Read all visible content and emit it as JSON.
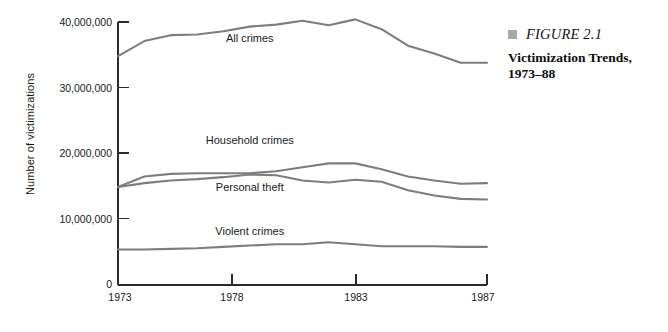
{
  "caption": {
    "bullet_icon": "filled-square-icon",
    "figure_number": "FIGURE 2.1",
    "title": "Victimization Trends, 1973–88",
    "bullet_color": "#a8a8a8"
  },
  "axes": {
    "y_axis_title": "Number of victimizations",
    "y_ticks": [
      "10,000,000",
      "20,000,000",
      "30,000,000",
      "40,000,000"
    ],
    "x_ticks": [
      "1973",
      "1978",
      "1983",
      "1987"
    ],
    "origin_label": "0"
  },
  "chart_data": {
    "type": "line",
    "title": "Victimization Trends, 1973–88",
    "xlabel": "",
    "ylabel": "Number of victimizations",
    "xlim": [
      1973,
      1987
    ],
    "ylim": [
      0,
      40000000
    ],
    "grid": false,
    "legend": "inline-labels",
    "line_color": "#7d7d7d",
    "x": [
      1973,
      1974,
      1975,
      1976,
      1977,
      1978,
      1979,
      1980,
      1981,
      1982,
      1983,
      1984,
      1985,
      1986,
      1987
    ],
    "series": [
      {
        "name": "All crimes",
        "label_x": 1978,
        "label_y": 37000000,
        "values": [
          34800000,
          37100000,
          38000000,
          38100000,
          38600000,
          39300000,
          39600000,
          40200000,
          39500000,
          40400000,
          38900000,
          36400000,
          35200000,
          33800000,
          33800000
        ]
      },
      {
        "name": "Household crimes",
        "label_x": 1978,
        "label_y": 21400000,
        "values": [
          14900000,
          16500000,
          16900000,
          17000000,
          17000000,
          17000000,
          17300000,
          17900000,
          18500000,
          18500000,
          17600000,
          16500000,
          15900000,
          15400000,
          15500000
        ]
      },
      {
        "name": "Personal theft",
        "label_x": 1978,
        "label_y": 14300000,
        "values": [
          14900000,
          15500000,
          15900000,
          16100000,
          16400000,
          16800000,
          16700000,
          15900000,
          15600000,
          16000000,
          15700000,
          14400000,
          13600000,
          13100000,
          13000000
        ]
      },
      {
        "name": "Violent crimes",
        "label_x": 1978,
        "label_y": 7600000,
        "values": [
          5400000,
          5400000,
          5500000,
          5600000,
          5800000,
          6000000,
          6200000,
          6200000,
          6500000,
          6200000,
          5900000,
          5900000,
          5900000,
          5800000,
          5800000
        ]
      }
    ]
  }
}
